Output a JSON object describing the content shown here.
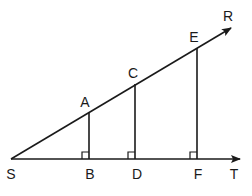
{
  "diagram": {
    "title": "",
    "stroke_color": "#1a1a1a",
    "points": [
      {
        "id": "S",
        "label": "S",
        "x": 11,
        "y": 159,
        "label_x": 11,
        "label_y": 174
      },
      {
        "id": "A",
        "label": "A",
        "x": 89,
        "y": 112,
        "label_x": 85,
        "label_y": 102
      },
      {
        "id": "B",
        "label": "B",
        "x": 89,
        "y": 159,
        "label_x": 90,
        "label_y": 174
      },
      {
        "id": "C",
        "label": "C",
        "x": 135,
        "y": 84,
        "label_x": 133,
        "label_y": 73
      },
      {
        "id": "D",
        "label": "D",
        "x": 135,
        "y": 159,
        "label_x": 137,
        "label_y": 174
      },
      {
        "id": "E",
        "label": "E",
        "x": 197,
        "y": 48,
        "label_x": 194,
        "label_y": 37
      },
      {
        "id": "F",
        "label": "F",
        "x": 197,
        "y": 159,
        "label_x": 198,
        "label_y": 174
      },
      {
        "id": "R",
        "label": "R",
        "x": 231,
        "y": 28,
        "label_x": 228,
        "label_y": 16
      },
      {
        "id": "T",
        "label": "T",
        "x": 240,
        "y": 159,
        "label_x": 234,
        "label_y": 174
      }
    ],
    "rays": [
      {
        "name": "ray-SR",
        "from": "S",
        "to": "R",
        "arrow": true
      },
      {
        "name": "ray-ST",
        "from": "S",
        "to": "T",
        "arrow": true
      }
    ],
    "segments": [
      {
        "name": "segment-AB",
        "from": "A",
        "to": "B"
      },
      {
        "name": "segment-CD",
        "from": "C",
        "to": "D"
      },
      {
        "name": "segment-EF",
        "from": "E",
        "to": "F"
      }
    ],
    "right_angles": [
      {
        "name": "right-angle-B",
        "at": "B"
      },
      {
        "name": "right-angle-D",
        "at": "D"
      },
      {
        "name": "right-angle-F",
        "at": "F"
      }
    ],
    "right_angle_size": 7
  }
}
